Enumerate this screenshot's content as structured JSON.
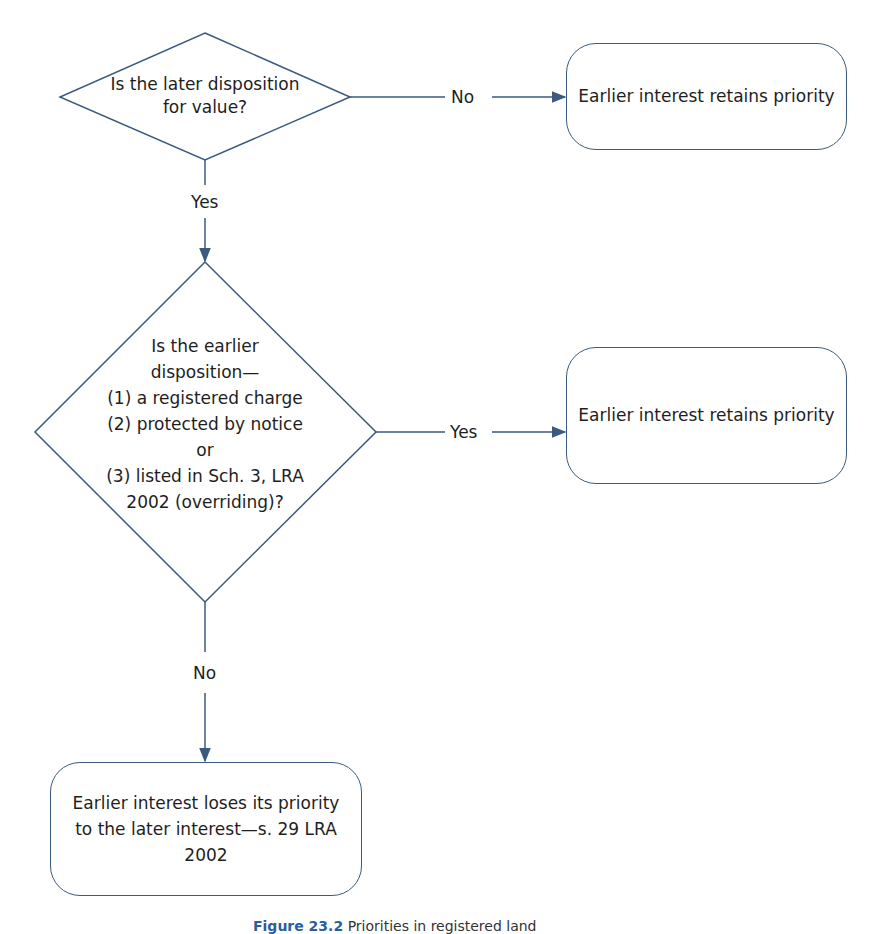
{
  "flowchart": {
    "decision_1": {
      "text_line1": "Is the later disposition",
      "text_line2": "for value?"
    },
    "edge_1_no_label": "No",
    "outcome_1": "Earlier interest retains priority",
    "edge_1_yes_label": "Yes",
    "decision_2": {
      "lines": [
        "Is the earlier",
        "disposition—",
        "(1) a registered charge",
        "(2) protected by notice",
        "or",
        "(3) listed in Sch. 3, LRA",
        "2002 (overriding)?"
      ]
    },
    "edge_2_yes_label": "Yes",
    "outcome_2": "Earlier interest retains priority",
    "edge_2_no_label": "No",
    "outcome_3": {
      "lines": [
        "Earlier interest loses its priority",
        "to the later interest—s. 29 LRA",
        "2002"
      ]
    }
  },
  "caption": {
    "figure_number": "Figure 23.2",
    "title": "Priorities in registered land"
  },
  "colors": {
    "stroke": "#3a5a80",
    "caption_accent": "#2a5d9f",
    "text": "#1e1e1e"
  }
}
